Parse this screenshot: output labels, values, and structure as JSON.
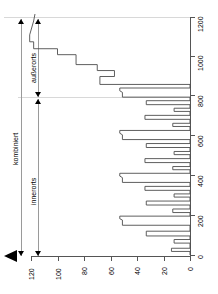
{
  "chart_data": {
    "type": "line",
    "orientation": "rotated-90",
    "title": "",
    "xlabel": "",
    "ylabel": "",
    "value_axis": {
      "name": "value-axis",
      "ticks": [
        120,
        100,
        80,
        60,
        40,
        20,
        0
      ],
      "tick_labels": [
        "120",
        "100",
        "80",
        "60",
        "40",
        "20",
        "0"
      ],
      "range": [
        0,
        130
      ],
      "position": "bottom"
    },
    "index_axis": {
      "name": "index-axis",
      "ticks": [
        1200,
        1000,
        800,
        600,
        400,
        200,
        0
      ],
      "tick_labels": [
        "1200",
        "1000",
        "800",
        "600",
        "400",
        "200",
        "0"
      ],
      "range": [
        0,
        1240
      ],
      "position": "right"
    },
    "grid": false,
    "legend": null,
    "series": [
      {
        "name": "verbrauch",
        "color": "#4d4d4d",
        "points": [
          [
            0,
            0
          ],
          [
            18,
            0
          ],
          [
            18,
            14
          ],
          [
            34,
            14
          ],
          [
            34,
            0
          ],
          [
            60,
            0
          ],
          [
            60,
            12
          ],
          [
            78,
            12
          ],
          [
            78,
            0
          ],
          [
            96,
            0
          ],
          [
            96,
            33
          ],
          [
            120,
            33
          ],
          [
            120,
            0
          ],
          [
            150,
            0
          ],
          [
            150,
            51
          ],
          [
            176,
            51
          ],
          [
            183,
            53
          ],
          [
            196,
            53
          ],
          [
            196,
            0
          ],
          [
            214,
            0
          ],
          [
            214,
            13
          ],
          [
            232,
            13
          ],
          [
            232,
            0
          ],
          [
            252,
            0
          ],
          [
            252,
            33
          ],
          [
            272,
            33
          ],
          [
            272,
            0
          ],
          [
            292,
            0
          ],
          [
            292,
            12
          ],
          [
            308,
            12
          ],
          [
            308,
            0
          ],
          [
            326,
            0
          ],
          [
            326,
            34
          ],
          [
            346,
            34
          ],
          [
            346,
            0
          ],
          [
            366,
            0
          ],
          [
            366,
            51
          ],
          [
            390,
            51
          ],
          [
            398,
            53
          ],
          [
            412,
            53
          ],
          [
            412,
            0
          ],
          [
            430,
            0
          ],
          [
            430,
            13
          ],
          [
            446,
            13
          ],
          [
            446,
            0
          ],
          [
            466,
            0
          ],
          [
            466,
            34
          ],
          [
            486,
            34
          ],
          [
            486,
            0
          ],
          [
            506,
            0
          ],
          [
            506,
            12
          ],
          [
            522,
            12
          ],
          [
            522,
            0
          ],
          [
            542,
            0
          ],
          [
            542,
            33
          ],
          [
            562,
            33
          ],
          [
            562,
            0
          ],
          [
            582,
            0
          ],
          [
            582,
            51
          ],
          [
            606,
            51
          ],
          [
            614,
            53
          ],
          [
            628,
            53
          ],
          [
            628,
            0
          ],
          [
            648,
            0
          ],
          [
            648,
            13
          ],
          [
            664,
            13
          ],
          [
            664,
            0
          ],
          [
            684,
            0
          ],
          [
            684,
            34
          ],
          [
            704,
            34
          ],
          [
            704,
            0
          ],
          [
            724,
            0
          ],
          [
            724,
            12
          ],
          [
            740,
            12
          ],
          [
            740,
            0
          ],
          [
            758,
            0
          ],
          [
            758,
            33
          ],
          [
            778,
            33
          ],
          [
            778,
            0
          ],
          [
            796,
            0
          ],
          [
            796,
            51
          ],
          [
            820,
            51
          ],
          [
            828,
            53
          ],
          [
            842,
            53
          ],
          [
            842,
            0
          ],
          [
            860,
            0
          ],
          [
            860,
            68
          ],
          [
            900,
            68
          ],
          [
            900,
            57
          ],
          [
            930,
            57
          ],
          [
            930,
            70
          ],
          [
            960,
            70
          ],
          [
            960,
            86
          ],
          [
            1010,
            86
          ],
          [
            1010,
            100
          ],
          [
            1040,
            100
          ],
          [
            1040,
            118
          ],
          [
            1075,
            118
          ],
          [
            1075,
            121
          ],
          [
            1110,
            121
          ],
          [
            1180,
            118
          ],
          [
            1215,
            117
          ]
        ]
      }
    ],
    "annotations": [
      {
        "name": "bracket-kombiniert",
        "label": "kombiniert",
        "from": 0,
        "to": 1215
      },
      {
        "name": "bracket-innerorts",
        "label": "innerorts",
        "from": 0,
        "to": 845
      },
      {
        "name": "bracket-ausserorts",
        "label": "außerorts",
        "from": 845,
        "to": 1215
      }
    ]
  },
  "labels": {
    "kombiniert": "kombiniert",
    "innerorts": "innerorts",
    "ausserorts": "außerorts"
  },
  "axis_value": {
    "t0": "120",
    "t1": "100",
    "t2": "80",
    "t3": "60",
    "t4": "40",
    "t5": "20",
    "t6": "0"
  },
  "axis_index": {
    "t0": "1200",
    "t1": "1000",
    "t2": "800",
    "t3": "600",
    "t4": "400",
    "t5": "200",
    "t6": "0"
  },
  "colors": {
    "series": "#4d4d4d",
    "axis": "#555555",
    "bracket": "#9a9a9a",
    "separator": "#d8d8d8"
  }
}
